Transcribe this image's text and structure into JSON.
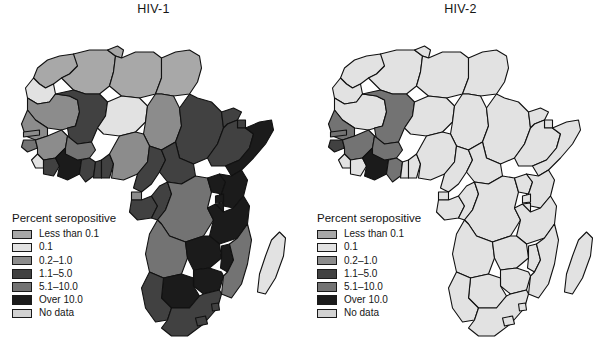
{
  "figure": {
    "caption_sliver": "",
    "background": "#ffffff"
  },
  "legend_scale": {
    "title": "Percent seropositive",
    "classes": [
      {
        "key": "lt01",
        "label": "Less than 0.1",
        "color": "#a8a8a8"
      },
      {
        "key": "p01",
        "label": "0.1",
        "color": "#e2e2e2"
      },
      {
        "key": "p02_10",
        "label": "0.2–1.0",
        "color": "#8c8c8c"
      },
      {
        "key": "p11_50",
        "label": "1.1–5.0",
        "color": "#414141"
      },
      {
        "key": "p51_100",
        "label": "5.1–10.0",
        "color": "#737373"
      },
      {
        "key": "over10",
        "label": "Over 10.0",
        "color": "#1b1b1b"
      },
      {
        "key": "nodata",
        "label": "No data",
        "color": "#d2d2d2"
      }
    ]
  },
  "panels": [
    {
      "id": "hiv1",
      "title": "HIV-1",
      "country_classes": {
        "morocco": "lt01",
        "western_sahara": "p01",
        "algeria": "lt01",
        "tunisia": "lt01",
        "libya": "lt01",
        "egypt": "lt01",
        "mauritania": "p02_10",
        "mali": "p11_50",
        "niger": "p01",
        "chad": "p02_10",
        "sudan": "p11_50",
        "eritrea": "p11_50",
        "djibouti": "p11_50",
        "ethiopia": "p11_50",
        "somalia": "over10",
        "senegal": "p02_10",
        "gambia": "p02_10",
        "guinea_bissau": "p51_100",
        "guinea": "p02_10",
        "sierra_leone": "p01",
        "liberia": "p11_50",
        "cote_divoire": "over10",
        "burkina_faso": "p51_100",
        "ghana": "p11_50",
        "togo": "p11_50",
        "benin": "p11_50",
        "nigeria": "p02_10",
        "cameroon": "p11_50",
        "central_african_republic": "p11_50",
        "equatorial_guinea": "p02_10",
        "gabon": "p11_50",
        "congo": "p11_50",
        "drc": "p51_100",
        "uganda": "over10",
        "kenya": "over10",
        "rwanda": "over10",
        "burundi": "over10",
        "tanzania": "over10",
        "angola": "p51_100",
        "zambia": "over10",
        "malawi": "over10",
        "mozambique": "p51_100",
        "zimbabwe": "over10",
        "botswana": "over10",
        "namibia": "p11_50",
        "south_africa": "p11_50",
        "lesotho": "p11_50",
        "swaziland": "p11_50",
        "madagascar": "p01"
      }
    },
    {
      "id": "hiv2",
      "title": "HIV-2",
      "country_classes": {
        "morocco": "p01",
        "western_sahara": "p01",
        "algeria": "p01",
        "tunisia": "p01",
        "libya": "p01",
        "egypt": "p01",
        "mauritania": "p01",
        "mali": "p51_100",
        "niger": "p01",
        "chad": "p01",
        "sudan": "p01",
        "eritrea": "p01",
        "djibouti": "p01",
        "ethiopia": "p01",
        "somalia": "p01",
        "senegal": "p51_100",
        "gambia": "p51_100",
        "guinea_bissau": "p11_50",
        "guinea": "p51_100",
        "sierra_leone": "p01",
        "liberia": "p01",
        "cote_divoire": "over10",
        "burkina_faso": "p51_100",
        "ghana": "p51_100",
        "togo": "p01",
        "benin": "p01",
        "nigeria": "p01",
        "cameroon": "p01",
        "central_african_republic": "p01",
        "equatorial_guinea": "p01",
        "gabon": "p01",
        "congo": "p01",
        "drc": "p01",
        "uganda": "p01",
        "kenya": "p01",
        "rwanda": "p01",
        "burundi": "p01",
        "tanzania": "p01",
        "angola": "p01",
        "zambia": "p01",
        "malawi": "p01",
        "mozambique": "p01",
        "zimbabwe": "p01",
        "botswana": "p01",
        "namibia": "p01",
        "south_africa": "p01",
        "lesotho": "p01",
        "swaziland": "p01",
        "madagascar": "p01"
      }
    }
  ]
}
